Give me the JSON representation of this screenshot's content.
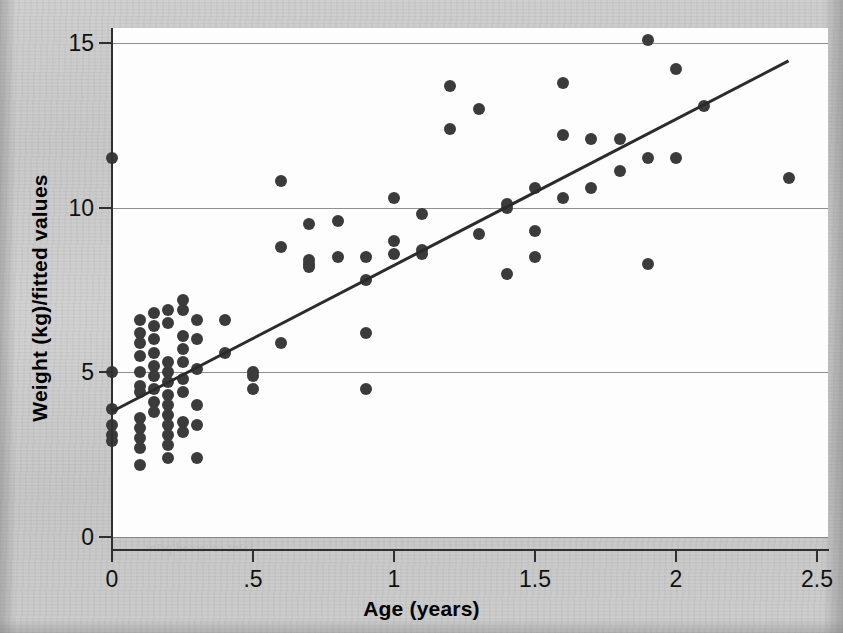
{
  "figure": {
    "background_color": "#c9c9c9",
    "plot_background_color": "#fdfdfd",
    "marker_color": "#3b3b3b",
    "line_color": "#2b2b2b",
    "grid_color": "#7b7b7b"
  },
  "bleed_text": [
    "scanned page show-through text",
    "faint reversed print",
    "illegible bleed-through",
    "from the facing page"
  ],
  "chart_data": {
    "type": "scatter",
    "title": "",
    "xlabel": "Age (years)",
    "ylabel": "Weight (kg)/fitted values",
    "xlim": [
      0,
      2.5
    ],
    "ylim": [
      0,
      15
    ],
    "xticks": [
      0,
      0.5,
      1,
      1.5,
      2,
      2.5
    ],
    "xtick_labels": [
      "0",
      ".5",
      "1",
      "1.5",
      "2",
      "2.5"
    ],
    "yticks": [
      0,
      5,
      10,
      15
    ],
    "ytick_labels": [
      "0",
      "5",
      "10",
      "15"
    ],
    "grid": "horizontal",
    "legend": "none",
    "series": [
      {
        "name": "Weight (kg)",
        "type": "scatter",
        "marker": "filled-circle",
        "points": [
          [
            0.0,
            11.5
          ],
          [
            0.0,
            5.0
          ],
          [
            0.0,
            3.9
          ],
          [
            0.0,
            3.4
          ],
          [
            0.0,
            3.1
          ],
          [
            0.0,
            2.9
          ],
          [
            0.1,
            6.6
          ],
          [
            0.1,
            6.2
          ],
          [
            0.1,
            5.9
          ],
          [
            0.1,
            5.5
          ],
          [
            0.1,
            5.0
          ],
          [
            0.1,
            4.6
          ],
          [
            0.1,
            4.4
          ],
          [
            0.1,
            3.6
          ],
          [
            0.1,
            3.3
          ],
          [
            0.1,
            3.0
          ],
          [
            0.1,
            2.7
          ],
          [
            0.1,
            2.2
          ],
          [
            0.15,
            6.8
          ],
          [
            0.15,
            6.4
          ],
          [
            0.15,
            6.0
          ],
          [
            0.15,
            5.6
          ],
          [
            0.15,
            5.2
          ],
          [
            0.15,
            4.9
          ],
          [
            0.15,
            4.5
          ],
          [
            0.15,
            4.1
          ],
          [
            0.15,
            3.8
          ],
          [
            0.2,
            6.9
          ],
          [
            0.2,
            6.5
          ],
          [
            0.2,
            5.3
          ],
          [
            0.2,
            5.0
          ],
          [
            0.2,
            4.7
          ],
          [
            0.2,
            4.3
          ],
          [
            0.2,
            4.0
          ],
          [
            0.2,
            3.7
          ],
          [
            0.2,
            3.4
          ],
          [
            0.2,
            3.1
          ],
          [
            0.2,
            2.8
          ],
          [
            0.2,
            2.4
          ],
          [
            0.25,
            7.2
          ],
          [
            0.25,
            6.9
          ],
          [
            0.25,
            6.1
          ],
          [
            0.25,
            5.7
          ],
          [
            0.25,
            5.3
          ],
          [
            0.25,
            4.8
          ],
          [
            0.25,
            4.4
          ],
          [
            0.25,
            3.5
          ],
          [
            0.25,
            3.2
          ],
          [
            0.3,
            6.6
          ],
          [
            0.3,
            6.0
          ],
          [
            0.3,
            5.1
          ],
          [
            0.3,
            4.0
          ],
          [
            0.3,
            3.4
          ],
          [
            0.3,
            2.4
          ],
          [
            0.4,
            6.6
          ],
          [
            0.4,
            5.6
          ],
          [
            0.5,
            5.0
          ],
          [
            0.5,
            4.9
          ],
          [
            0.5,
            4.5
          ],
          [
            0.6,
            10.8
          ],
          [
            0.6,
            8.8
          ],
          [
            0.6,
            5.9
          ],
          [
            0.7,
            9.5
          ],
          [
            0.7,
            8.4
          ],
          [
            0.7,
            8.3
          ],
          [
            0.7,
            8.2
          ],
          [
            0.8,
            9.6
          ],
          [
            0.8,
            8.5
          ],
          [
            0.9,
            8.5
          ],
          [
            0.9,
            7.8
          ],
          [
            0.9,
            6.2
          ],
          [
            0.9,
            4.5
          ],
          [
            1.0,
            10.3
          ],
          [
            1.0,
            9.0
          ],
          [
            1.0,
            8.6
          ],
          [
            1.1,
            9.8
          ],
          [
            1.1,
            8.7
          ],
          [
            1.1,
            8.6
          ],
          [
            1.2,
            13.7
          ],
          [
            1.2,
            12.4
          ],
          [
            1.3,
            13.0
          ],
          [
            1.3,
            9.2
          ],
          [
            1.4,
            10.1
          ],
          [
            1.4,
            10.0
          ],
          [
            1.4,
            8.0
          ],
          [
            1.5,
            10.6
          ],
          [
            1.5,
            9.3
          ],
          [
            1.5,
            8.5
          ],
          [
            1.6,
            13.8
          ],
          [
            1.6,
            12.2
          ],
          [
            1.6,
            10.3
          ],
          [
            1.7,
            12.1
          ],
          [
            1.7,
            10.6
          ],
          [
            1.8,
            12.1
          ],
          [
            1.8,
            11.1
          ],
          [
            1.9,
            15.1
          ],
          [
            1.9,
            11.5
          ],
          [
            1.9,
            8.3
          ],
          [
            2.0,
            14.2
          ],
          [
            2.0,
            11.5
          ],
          [
            2.1,
            13.1
          ],
          [
            2.4,
            10.9
          ]
        ]
      },
      {
        "name": "Fitted values",
        "type": "line",
        "endpoints": [
          [
            0.0,
            3.8
          ],
          [
            2.4,
            14.45
          ]
        ],
        "intercept": 3.8,
        "slope": 4.44
      }
    ]
  }
}
